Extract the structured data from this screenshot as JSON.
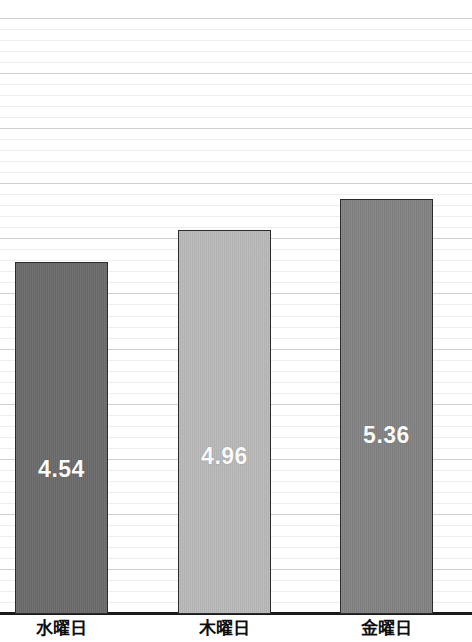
{
  "chart_data": {
    "type": "bar",
    "title": "",
    "subtitle": "",
    "xlabel": "",
    "ylabel": "",
    "categories": [
      "水曜日",
      "木曜日",
      "金曜日"
    ],
    "values": [
      4.54,
      4.96,
      5.36
    ],
    "value_labels": [
      "4.54",
      "4.96",
      "5.36"
    ],
    "bar_colors": [
      "#6a6a6a",
      "#b8b8b8",
      "#828282"
    ],
    "bar_border_color": "#2b2b2b",
    "value_label_color": "#ffffff",
    "ylim": [
      0,
      7.7
    ],
    "grid": {
      "visible": true,
      "orientation": "horizontal",
      "minor_color": "#eeeeee",
      "major_color": "#d0d0d0",
      "minor_step_value": 0.1375,
      "major_every": 5
    },
    "axis": {
      "baseline_color": "#1a1a1a",
      "tick_labels_visible": false,
      "y_ticks": []
    },
    "legend": {
      "visible": false,
      "position": "none",
      "entries": []
    },
    "annotations": []
  },
  "bars": [
    {
      "name": "bar-wednesday",
      "category": "水曜日",
      "value_label": "4.54"
    },
    {
      "name": "bar-thursday",
      "category": "木曜日",
      "value_label": "4.96"
    },
    {
      "name": "bar-friday",
      "category": "金曜日",
      "value_label": "5.36"
    }
  ]
}
